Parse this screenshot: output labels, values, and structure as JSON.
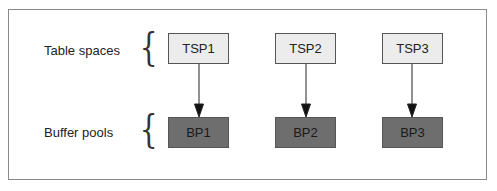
{
  "rows": {
    "table_spaces_label": "Table spaces",
    "buffer_pools_label": "Buffer pools"
  },
  "table_spaces": [
    {
      "label": "TSP1"
    },
    {
      "label": "TSP2"
    },
    {
      "label": "TSP3"
    }
  ],
  "buffer_pools": [
    {
      "label": "BP1"
    },
    {
      "label": "BP2"
    },
    {
      "label": "BP3"
    }
  ],
  "colors": {
    "table_space_fill": "#ececec",
    "buffer_pool_fill": "#6e6e6e",
    "border": "#555555"
  }
}
